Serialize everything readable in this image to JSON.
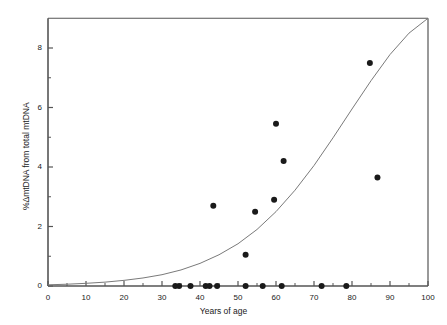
{
  "chart_data": {
    "type": "scatter",
    "title": "",
    "xlabel": "Years of age",
    "ylabel": "%ΔmtDNA from total mtDNA",
    "xlim": [
      0,
      100
    ],
    "ylim": [
      0,
      9
    ],
    "xticks": [
      0,
      10,
      20,
      30,
      40,
      50,
      60,
      70,
      80,
      90,
      100
    ],
    "xtick_labels": [
      "0",
      "10",
      "20",
      "30",
      "40",
      "50",
      "60",
      "70",
      "80",
      "90",
      "100"
    ],
    "yticks": [
      0,
      2,
      4,
      6,
      8
    ],
    "ytick_labels": [
      "0",
      "2",
      "4",
      "6",
      "8"
    ],
    "x_minor_ticks": [
      5,
      15,
      25,
      35,
      45,
      55,
      65,
      75,
      85,
      95
    ],
    "y_minor_ticks": [
      1,
      3,
      5,
      7
    ],
    "grid": false,
    "legend": null,
    "marker": {
      "shape": "circle",
      "color": "#1a1a1a",
      "size": 6
    },
    "series": [
      {
        "name": "samples",
        "points": [
          {
            "x": 33.5,
            "y": 0.0
          },
          {
            "x": 34.5,
            "y": 0.0
          },
          {
            "x": 37.5,
            "y": 0.0
          },
          {
            "x": 41.5,
            "y": 0.0
          },
          {
            "x": 42.5,
            "y": 0.0
          },
          {
            "x": 44.5,
            "y": 0.0
          },
          {
            "x": 43.5,
            "y": 2.7
          },
          {
            "x": 52.0,
            "y": 0.0
          },
          {
            "x": 52.0,
            "y": 1.05
          },
          {
            "x": 54.5,
            "y": 2.5
          },
          {
            "x": 56.5,
            "y": 0.0
          },
          {
            "x": 59.5,
            "y": 2.9
          },
          {
            "x": 60.0,
            "y": 5.45
          },
          {
            "x": 61.5,
            "y": 0.0
          },
          {
            "x": 62.0,
            "y": 4.2
          },
          {
            "x": 72.0,
            "y": 0.0
          },
          {
            "x": 78.5,
            "y": 0.0
          },
          {
            "x": 84.7,
            "y": 7.5
          },
          {
            "x": 86.7,
            "y": 3.65
          }
        ]
      }
    ],
    "fit_curve": {
      "name": "exponential trend",
      "color": "#7a7a7a",
      "width": 1,
      "description": "exponential curve rising from near 0 at age 0 to 9 at age 100",
      "points": [
        {
          "x": 0,
          "y": 0.04
        },
        {
          "x": 5,
          "y": 0.06
        },
        {
          "x": 10,
          "y": 0.09
        },
        {
          "x": 15,
          "y": 0.13
        },
        {
          "x": 20,
          "y": 0.19
        },
        {
          "x": 25,
          "y": 0.27
        },
        {
          "x": 30,
          "y": 0.38
        },
        {
          "x": 35,
          "y": 0.54
        },
        {
          "x": 40,
          "y": 0.76
        },
        {
          "x": 45,
          "y": 1.05
        },
        {
          "x": 50,
          "y": 1.42
        },
        {
          "x": 55,
          "y": 1.9
        },
        {
          "x": 60,
          "y": 2.5
        },
        {
          "x": 65,
          "y": 3.22
        },
        {
          "x": 70,
          "y": 4.05
        },
        {
          "x": 75,
          "y": 4.98
        },
        {
          "x": 80,
          "y": 5.95
        },
        {
          "x": 85,
          "y": 6.9
        },
        {
          "x": 90,
          "y": 7.78
        },
        {
          "x": 95,
          "y": 8.5
        },
        {
          "x": 100,
          "y": 9.0
        }
      ]
    },
    "axes_style": {
      "frame_color": "#555555",
      "spines": [
        "left",
        "bottom"
      ],
      "tick_direction": "in"
    }
  }
}
